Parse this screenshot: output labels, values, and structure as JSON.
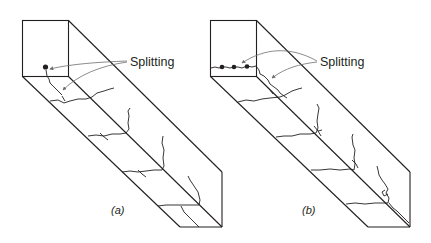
{
  "figure": {
    "panels": [
      {
        "id": "a",
        "caption_open": "(",
        "caption_letter": "a",
        "caption_close": ")",
        "annotation": "Splitting",
        "reinforcement": "single bar"
      },
      {
        "id": "b",
        "caption_open": "(",
        "caption_letter": "b",
        "caption_close": ")",
        "annotation": "Splitting",
        "reinforcement": "row of bars"
      }
    ],
    "colors": {
      "line": "#231f20",
      "leader": "#6d6e71",
      "background": "#ffffff"
    }
  }
}
